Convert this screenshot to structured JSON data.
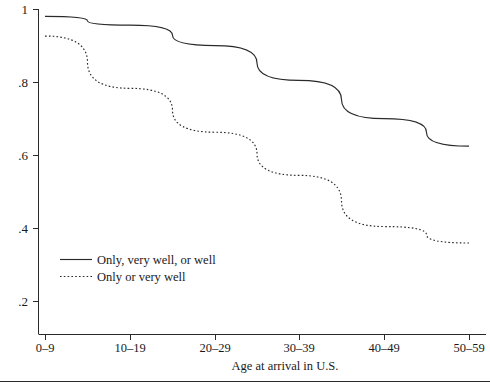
{
  "chart_data": {
    "type": "line",
    "title": "",
    "subtitle": "",
    "xlabel": "Age at arrival in U.S.",
    "ylabel": "",
    "categories": [
      "0–9",
      "10–19",
      "20–29",
      "30–39",
      "40–49",
      "50–59"
    ],
    "xtick_labels": [
      "0–9",
      "10–19",
      "20–29",
      "30–39",
      "40–49",
      "50–59"
    ],
    "ytick_labels": [
      "1",
      ".8",
      ".6",
      ".4",
      ".2"
    ],
    "ytick_values": [
      1,
      0.8,
      0.6,
      0.4,
      0.2
    ],
    "ylim": [
      0.125,
      1.0
    ],
    "xlim": [
      -0.28,
      5.28
    ],
    "grid": false,
    "legend_position": "inside-lower-left",
    "series": [
      {
        "name": "Only, very well, or well",
        "style": "solid",
        "color": "#2a2a2a",
        "values": [
          0.98,
          0.956,
          0.9,
          0.805,
          0.7,
          0.625
        ]
      },
      {
        "name": "Only or very well",
        "style": "dotted",
        "color": "#2a2a2a",
        "values": [
          0.926,
          0.783,
          0.663,
          0.545,
          0.405,
          0.36
        ]
      }
    ],
    "legend": [
      {
        "label": "Only, very well, or well",
        "style": "solid"
      },
      {
        "label": "Only or very well",
        "style": "dotted"
      }
    ]
  }
}
